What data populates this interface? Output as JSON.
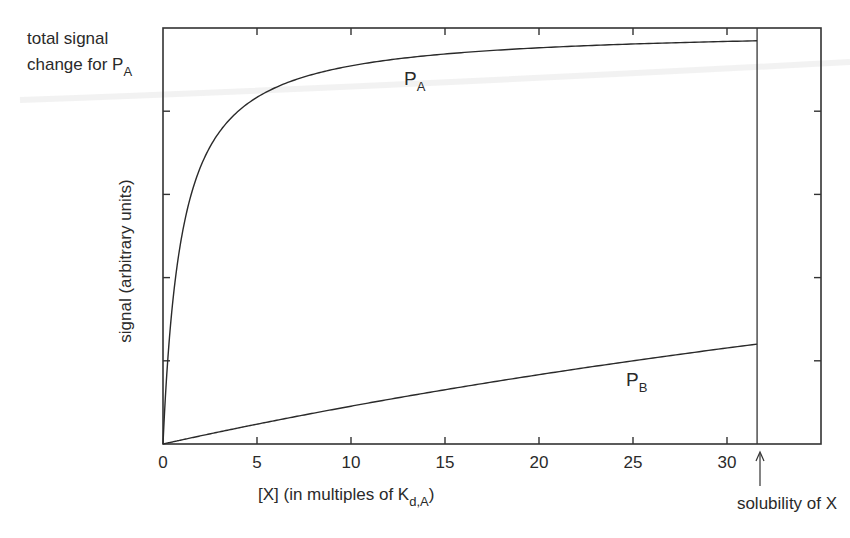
{
  "chart_data": {
    "type": "line",
    "title": "",
    "xlabel": "[X] (in multiples of K",
    "xlabel_sub": "d,A",
    "xlabel_close": ")",
    "ylabel": "signal (arbitrary units)",
    "xlim": [
      0,
      35
    ],
    "ylim": [
      0,
      1.0
    ],
    "x_ticks": [
      0,
      5,
      10,
      15,
      20,
      25,
      30
    ],
    "x_tick_labels": [
      "0",
      "5",
      "10",
      "15",
      "20",
      "25",
      "30"
    ],
    "y_ticks": [
      0.2,
      0.4,
      0.6,
      0.8
    ],
    "y_tick_labels": [],
    "grid": false,
    "legend": null,
    "series": [
      {
        "name": "P_A",
        "label_main": "P",
        "label_sub": "A",
        "model": "x/(1+x)",
        "x": [
          0,
          0.25,
          0.5,
          1,
          1.5,
          2,
          3,
          4,
          5,
          6,
          8,
          10,
          12,
          15,
          20,
          25,
          31.6
        ],
        "values": [
          0,
          0.2,
          0.333,
          0.5,
          0.6,
          0.667,
          0.75,
          0.8,
          0.833,
          0.857,
          0.889,
          0.909,
          0.923,
          0.9375,
          0.952,
          0.962,
          0.969
        ]
      },
      {
        "name": "P_B",
        "label_main": "P",
        "label_sub": "B",
        "model": "x/(100+x)",
        "x": [
          0,
          5,
          10,
          15,
          20,
          25,
          31.6
        ],
        "values": [
          0,
          0.048,
          0.091,
          0.13,
          0.167,
          0.2,
          0.24
        ]
      }
    ],
    "annotations": [
      {
        "id": "total-signal",
        "text_line1": "total signal",
        "text_line2": "change for P",
        "text_sub": "A"
      },
      {
        "id": "solubility",
        "text": "solubility of X",
        "x": 31.6
      }
    ]
  }
}
